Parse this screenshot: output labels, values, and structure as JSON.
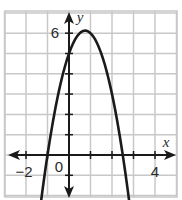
{
  "chart_data": {
    "type": "line",
    "title": "",
    "xlabel": "x",
    "ylabel": "y",
    "xlim": [
      -3,
      5
    ],
    "ylim": [
      -2,
      7
    ],
    "grid": true,
    "x_tick_labels": [
      {
        "value": -2,
        "label": "−2"
      },
      {
        "value": 0,
        "label": "0"
      },
      {
        "value": 4,
        "label": "4"
      }
    ],
    "y_tick_labels": [
      {
        "value": 6,
        "label": "6"
      }
    ],
    "series": [
      {
        "name": "parabola",
        "equation": "y = -2x^2 + 3x + 5",
        "x": [
          -1.5,
          -1,
          -0.5,
          0,
          0.5,
          0.75,
          1,
          1.5,
          2,
          2.5,
          3
        ],
        "y": [
          -2.0,
          0,
          3.0,
          5,
          6.0,
          6.125,
          6,
          5,
          3,
          0,
          -4
        ],
        "vertex": [
          0.75,
          6.125
        ],
        "y_intercept": 5,
        "x_intercepts": [
          -1,
          2.5
        ]
      }
    ],
    "colors": {
      "curve": "#1a1a1a",
      "axes": "#1a1a1a",
      "grid": "#c8c8c8"
    }
  }
}
